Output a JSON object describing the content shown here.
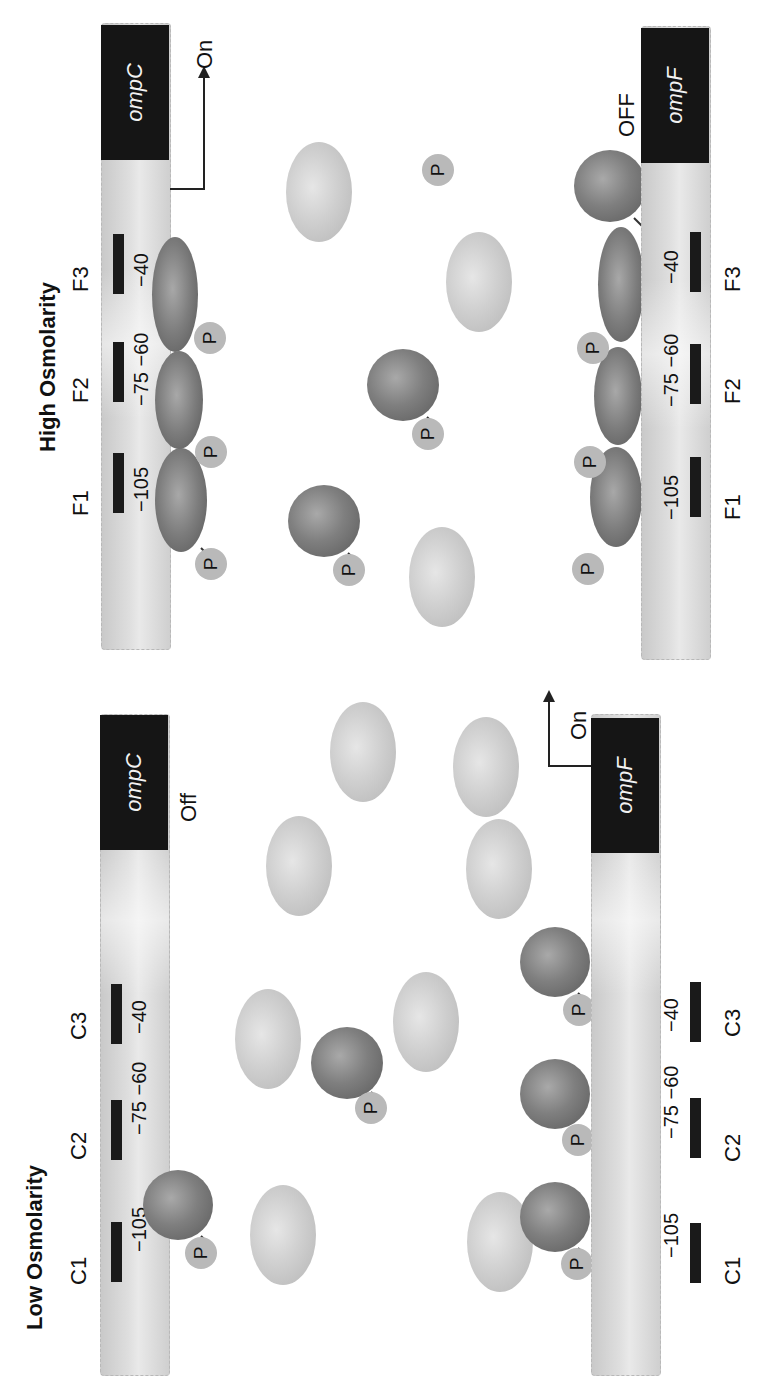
{
  "panels": {
    "low": {
      "title": "Low Osmolarity",
      "ompC": {
        "gene_label": "ompC",
        "state": "Off",
        "sites": [
          {
            "label": "C1",
            "coords": "−105"
          },
          {
            "label": "C2",
            "coords": "−75 −60"
          },
          {
            "label": "C3",
            "coords": "−40"
          }
        ]
      },
      "ompF": {
        "gene_label": "ompF",
        "state": "On",
        "sites": [
          {
            "label": "C1",
            "coords": "−105"
          },
          {
            "label": "C2",
            "coords": "−75 −60"
          },
          {
            "label": "C3",
            "coords": "−40"
          }
        ]
      }
    },
    "high": {
      "title": "High Osmolarity",
      "ompC": {
        "gene_label": "ompC",
        "state": "On",
        "sites": [
          {
            "label": "F1",
            "coords": "−105"
          },
          {
            "label": "F2",
            "coords": "−75 −60"
          },
          {
            "label": "F3",
            "coords": "−40"
          }
        ]
      },
      "ompF": {
        "gene_label": "ompF",
        "state": "OFF",
        "sites": [
          {
            "label": "F1",
            "coords": "−105"
          },
          {
            "label": "F2",
            "coords": "−75 −60"
          },
          {
            "label": "F3",
            "coords": "−40"
          }
        ]
      }
    }
  },
  "phospho_label": "P",
  "colors": {
    "gene_box": "#151515",
    "dna_bar": "#d6d6d6",
    "protein_dark": "#7a7a7a",
    "protein_light": "#cfcfcf",
    "phosphate": "#b9b9b9"
  }
}
